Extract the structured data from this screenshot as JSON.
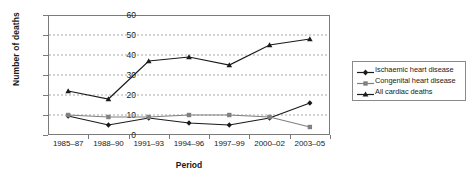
{
  "chart_data": {
    "type": "line",
    "title": "",
    "xlabel": "Period",
    "ylabel": "Number of deaths",
    "ylim": [
      0,
      60
    ],
    "yticks": [
      0,
      10,
      20,
      30,
      40,
      50,
      60
    ],
    "grid": "horizontal-dashed",
    "legend_position": "right",
    "categories": [
      "1985–87",
      "1988–90",
      "1991–93",
      "1994–96",
      "1997–99",
      "2000–02",
      "2003–05"
    ],
    "series": [
      {
        "name": "Ischaemic heart disease",
        "marker": "diamond",
        "color": "#1a1a1a",
        "values": [
          9.5,
          5,
          8.5,
          6,
          5,
          8.5,
          16
        ]
      },
      {
        "name": "Congenital heart disease",
        "marker": "square",
        "color": "#808080",
        "values": [
          10,
          9,
          9,
          10,
          10,
          9,
          4
        ]
      },
      {
        "name": "All cardiac deaths",
        "marker": "triangle",
        "color": "#1a1a1a",
        "values": [
          22,
          18,
          37,
          39,
          35,
          45,
          48
        ]
      }
    ]
  },
  "axis": {
    "y_title": "Number of deaths",
    "x_title": "Period",
    "y_tick_labels": [
      "60",
      "50",
      "40",
      "30",
      "20",
      "10",
      "0"
    ],
    "x_tick_labels": [
      "1985–87",
      "1988–90",
      "1991–93",
      "1994–96",
      "1997–99",
      "2000–02",
      "2003–05"
    ]
  },
  "legend": {
    "items": [
      {
        "label": "Ischaemic heart disease"
      },
      {
        "label": "Congenital heart disease"
      },
      {
        "label": "All cardiac deaths"
      }
    ]
  }
}
